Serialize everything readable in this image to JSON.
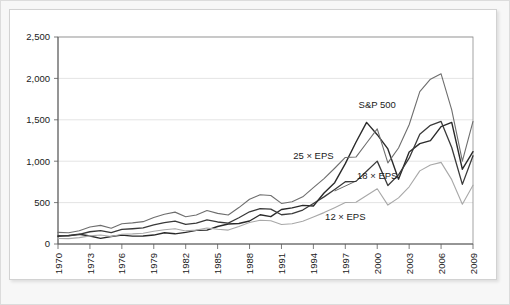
{
  "chart_data": {
    "type": "line",
    "title": "",
    "subtitle": "",
    "xlabel": "",
    "ylabel": "",
    "xlim": [
      1970,
      2009
    ],
    "ylim": [
      0,
      2500
    ],
    "grid": true,
    "legend_position": "inline-annotations",
    "ytick_labels": [
      "0",
      "500",
      "1,000",
      "1,500",
      "2,000",
      "2,500"
    ],
    "ytick_values": [
      0,
      500,
      1000,
      1500,
      2000,
      2500
    ],
    "xtick_labels": [
      "1970",
      "1973",
      "1976",
      "1979",
      "1982",
      "1985",
      "1988",
      "1991",
      "1994",
      "1997",
      "2000",
      "2003",
      "2006",
      "2009"
    ],
    "xtick_values": [
      1970,
      1973,
      1976,
      1979,
      1982,
      1985,
      1988,
      1991,
      1994,
      1997,
      2000,
      2003,
      2006,
      2009
    ],
    "x": [
      1970,
      1971,
      1972,
      1973,
      1974,
      1975,
      1976,
      1977,
      1978,
      1979,
      1980,
      1981,
      1982,
      1983,
      1984,
      1985,
      1986,
      1987,
      1988,
      1989,
      1990,
      1991,
      1992,
      1993,
      1994,
      1995,
      1996,
      1997,
      1998,
      1999,
      2000,
      2001,
      2002,
      2003,
      2004,
      2005,
      2006,
      2007,
      2008,
      2009
    ],
    "series": [
      {
        "name": "S&P 500",
        "color": "#2a2a2a",
        "width": 1.4,
        "label": "S&P 500",
        "label_x": 2000,
        "label_y": 1640,
        "values": [
          92,
          102,
          118,
          97,
          68,
          90,
          107,
          95,
          96,
          108,
          136,
          123,
          141,
          165,
          167,
          211,
          242,
          247,
          278,
          353,
          330,
          417,
          436,
          466,
          459,
          616,
          741,
          970,
          1229,
          1469,
          1320,
          1148,
          783,
          1112,
          1212,
          1248,
          1418,
          1468,
          903,
          1115
        ]
      },
      {
        "name": "25 × EPS",
        "color": "#6e6e6e",
        "width": 1.1,
        "label": "25 × EPS",
        "label_x": 1994,
        "label_y": 1030,
        "values": [
          140,
          135,
          160,
          205,
          225,
          190,
          245,
          255,
          270,
          320,
          360,
          385,
          330,
          350,
          405,
          370,
          350,
          440,
          540,
          595,
          585,
          490,
          510,
          570,
          680,
          790,
          915,
          1045,
          1050,
          1220,
          1390,
          980,
          1160,
          1440,
          1840,
          1990,
          2055,
          1620,
          1000,
          1480
        ]
      },
      {
        "name": "18 × EPS",
        "color": "#3a3a3a",
        "width": 1.3,
        "label": "18 × EPS",
        "label_x": 2000,
        "label_y": 780,
        "values": [
          100,
          97,
          115,
          148,
          162,
          137,
          176,
          184,
          194,
          230,
          259,
          277,
          238,
          252,
          292,
          266,
          252,
          317,
          389,
          428,
          421,
          353,
          367,
          410,
          490,
          569,
          659,
          752,
          756,
          878,
          1001,
          706,
          835,
          1037,
          1325,
          1433,
          1480,
          1166,
          720,
          1066
        ]
      },
      {
        "name": "12 × EPS",
        "color": "#a8a8a8",
        "width": 1.1,
        "label": "12 × EPS",
        "label_x": 1997,
        "label_y": 285,
        "values": [
          67,
          65,
          77,
          98,
          108,
          91,
          118,
          122,
          130,
          154,
          173,
          185,
          158,
          168,
          194,
          178,
          168,
          211,
          259,
          286,
          281,
          235,
          245,
          274,
          326,
          379,
          439,
          501,
          504,
          585,
          667,
          470,
          557,
          691,
          883,
          955,
          986,
          777,
          480,
          710
        ]
      }
    ],
    "annotations": [
      {
        "text": "18 × EPS",
        "leader": true,
        "from_x": 1998,
        "from_y": 760,
        "to_x": 1996,
        "to_y": 640
      }
    ]
  }
}
